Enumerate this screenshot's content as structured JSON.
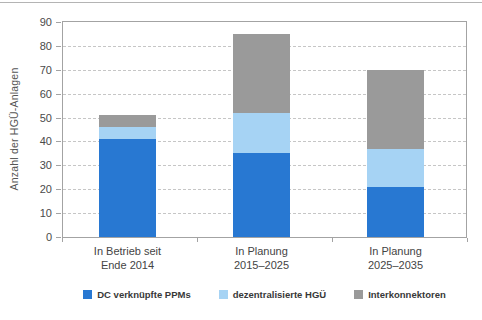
{
  "page": {
    "top_rule_color": "#b4b4b4"
  },
  "chart_data": {
    "type": "bar",
    "stacked": true,
    "title": "",
    "xlabel": "",
    "ylabel": "Anzahl der HGÜ-Anlagen",
    "ylim": [
      0,
      90
    ],
    "yticks": [
      0,
      10,
      20,
      30,
      40,
      50,
      60,
      70,
      80,
      90
    ],
    "grid": "horizontal-dashed",
    "legend_position": "bottom",
    "categories": [
      [
        "In Betrieb seit",
        "Ende 2014"
      ],
      [
        "In Planung",
        "2015–2025"
      ],
      [
        "In Planung",
        "2025–2035"
      ]
    ],
    "series": [
      {
        "name": "DC verknüpfte PPMs",
        "color": "#2878d2",
        "values": [
          41,
          35,
          21
        ]
      },
      {
        "name": "dezentralisierte HGÜ",
        "color": "#a6d3f4",
        "values": [
          5,
          17,
          16
        ]
      },
      {
        "name": "Interkonnektoren",
        "color": "#9a9a9a",
        "values": [
          5,
          33,
          33
        ]
      }
    ],
    "stack_totals": [
      51,
      85,
      70
    ],
    "colors": {
      "gridline": "#c6c6c6",
      "plot_border": "#a3a3a3",
      "tick_label": "#4a4a4a",
      "axis_title": "#555555",
      "legend_text": "#383838"
    }
  }
}
